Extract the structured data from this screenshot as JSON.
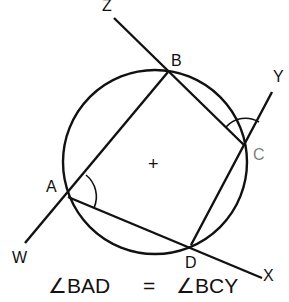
{
  "diagram": {
    "stroke_color": "#111111",
    "background": "#ffffff",
    "circle": {
      "cx": 155,
      "cy": 162,
      "r": 92
    },
    "center_mark": "+",
    "points": {
      "A": {
        "label": "A",
        "x": 68,
        "y": 197,
        "lx": 46,
        "ly": 192
      },
      "B": {
        "label": "B",
        "x": 168,
        "y": 72,
        "lx": 171,
        "ly": 66
      },
      "C": {
        "label": "C",
        "x": 244,
        "y": 145,
        "lx": 253,
        "ly": 160
      },
      "D": {
        "label": "D",
        "x": 191,
        "y": 245,
        "lx": 185,
        "ly": 268
      },
      "W": {
        "label": "W",
        "x": 25,
        "y": 243,
        "lx": 12,
        "ly": 263
      },
      "X": {
        "label": "X",
        "x": 262,
        "y": 278,
        "lx": 263,
        "ly": 281
      },
      "Y": {
        "label": "Y",
        "x": 272,
        "y": 92,
        "lx": 273,
        "ly": 82
      },
      "Z": {
        "label": "Z",
        "x": 114,
        "y": 18,
        "lx": 102,
        "ly": 11
      }
    },
    "segments": [
      {
        "from": "W",
        "to": "B",
        "name": "line-WAB"
      },
      {
        "from": "Z",
        "to": "C",
        "name": "line-ZBC"
      },
      {
        "from": "D",
        "to": "Y",
        "name": "line-DCY"
      },
      {
        "from": "A",
        "to": "X",
        "name": "line-ADX"
      }
    ],
    "angle_marks": [
      {
        "vertex": "A",
        "name": "angle-BAD",
        "radius": 28
      },
      {
        "vertex": "C",
        "name": "angle-BCY",
        "radius": 26
      }
    ],
    "equation": {
      "left": "∠BAD",
      "equals": "=",
      "right": "∠BCY"
    }
  }
}
